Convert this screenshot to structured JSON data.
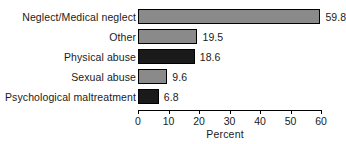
{
  "chart_data": {
    "type": "bar",
    "orientation": "horizontal",
    "title": "",
    "subtitle": "",
    "xlabel": "Percent",
    "ylabel": "",
    "categories": [
      "Neglect/Medical neglect",
      "Other",
      "Physical abuse",
      "Sexual abuse",
      "Psychological maltreatment"
    ],
    "values": [
      59.8,
      19.5,
      18.6,
      9.6,
      6.8
    ],
    "value_labels": [
      "59.8",
      "19.5",
      "18.6",
      "9.6",
      "6.8"
    ],
    "bar_colors": [
      "#8a8a8a",
      "#8a8a8a",
      "#1a1a1a",
      "#8a8a8a",
      "#1a1a1a"
    ],
    "bar_border_color": "#000000",
    "xlim": [
      0,
      60
    ],
    "xticks": [
      0,
      10,
      20,
      30,
      40,
      50,
      60
    ],
    "xtick_labels": [
      "0",
      "10",
      "20",
      "30",
      "40",
      "50",
      "60"
    ],
    "grid": false,
    "legend": false,
    "legend_position": "none"
  },
  "colors": {
    "background": "#ffffff",
    "text": "#1a1a1a",
    "axis": "#000000",
    "bar_gray": "#8a8a8a",
    "bar_dark": "#1a1a1a"
  }
}
